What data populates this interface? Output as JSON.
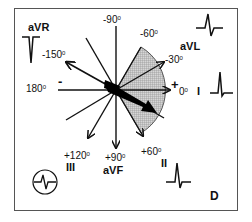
{
  "diagram": {
    "panel_label": "D",
    "center": [
      116,
      90
    ],
    "shaded_sector": {
      "from_deg": -60,
      "to_deg": 60,
      "color": "#bdbdbd"
    },
    "axes": [
      {
        "angle": -150,
        "label": "-150",
        "lead": "aVR",
        "arrow": true
      },
      {
        "angle": -90,
        "label": "-90",
        "lead": "",
        "arrow": false
      },
      {
        "angle": -60,
        "label": "-60",
        "lead": "",
        "arrow": false
      },
      {
        "angle": -30,
        "label": "-30",
        "lead": "aVL",
        "arrow": true
      },
      {
        "angle": 0,
        "label": "0",
        "lead": "I",
        "arrow": true
      },
      {
        "angle": 60,
        "label": "+60",
        "lead": "II",
        "arrow": true
      },
      {
        "angle": 90,
        "label": "+90",
        "lead": "aVF",
        "arrow": true
      },
      {
        "angle": 120,
        "label": "+120",
        "lead": "III",
        "arrow": true
      },
      {
        "angle": 180,
        "label": "180",
        "lead": "",
        "arrow": false
      }
    ],
    "mean_axis_deg": 30,
    "labels": {
      "deg_m150": "-150",
      "deg_m90": "-90",
      "deg_m60": "-60",
      "deg_m30": "-30",
      "deg_0": "0",
      "deg_180": "180",
      "deg_p120": "+120",
      "deg_p90": "+90",
      "deg_p60": "+60",
      "degree_symbol": "0",
      "plus_sign": "+",
      "minus_sign": "-"
    },
    "leads": {
      "avr": "aVR",
      "avl": "aVL",
      "i": "I",
      "ii": "II",
      "iii": "III",
      "avf": "aVF"
    },
    "waveforms": {
      "avr": "negative-deflection",
      "avl": "biphasic-upright",
      "i": "upright",
      "ii": "upright",
      "iii": "biphasic-isoelectric-circled",
      "avf": "biphasic"
    }
  }
}
